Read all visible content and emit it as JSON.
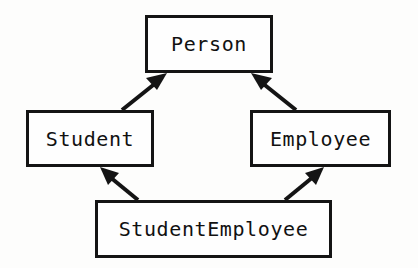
{
  "diagram": {
    "type": "class-inheritance-diagram",
    "background_color": "#fdfdfc",
    "line_color": "#141414",
    "box_fill_color": "#fefefe",
    "text_color": "#111111",
    "classes": [
      {
        "id": "person",
        "label": "Person",
        "role": "base-class",
        "x": 145,
        "y": 15,
        "width": 128,
        "height": 58
      },
      {
        "id": "student",
        "label": "Student",
        "role": "derived-class",
        "x": 26,
        "y": 110,
        "width": 128,
        "height": 57
      },
      {
        "id": "employee",
        "label": "Employee",
        "role": "derived-class",
        "x": 250,
        "y": 110,
        "width": 141,
        "height": 57
      },
      {
        "id": "studentemployee",
        "label": "StudentEmployee",
        "role": "derived-class",
        "x": 95,
        "y": 200,
        "width": 237,
        "height": 58
      }
    ],
    "edges": [
      {
        "id": "student-to-person",
        "from": "student",
        "to": "person",
        "kind": "inheritance",
        "arrowhead": "solid-filled-triangle"
      },
      {
        "id": "employee-to-person",
        "from": "employee",
        "to": "person",
        "kind": "inheritance",
        "arrowhead": "solid-filled-triangle"
      },
      {
        "id": "studentemployee-to-student",
        "from": "studentemployee",
        "to": "student",
        "kind": "inheritance",
        "arrowhead": "solid-filled-triangle"
      },
      {
        "id": "studentemployee-to-employee",
        "from": "studentemployee",
        "to": "employee",
        "kind": "inheritance",
        "arrowhead": "solid-filled-triangle"
      }
    ]
  }
}
